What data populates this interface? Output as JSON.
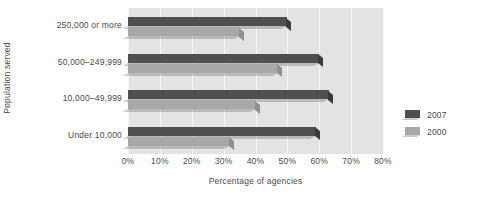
{
  "chart_data": {
    "type": "bar",
    "orientation": "horizontal",
    "title": "",
    "xlabel": "Percentage of agencies",
    "ylabel": "Population served",
    "categories": [
      "250,000 or more",
      "50,000–249,999",
      "10,000–49,999",
      "Under 10,000"
    ],
    "series": [
      {
        "name": "2007",
        "color": "#4f4f4f",
        "values": [
          50,
          60,
          63,
          59
        ]
      },
      {
        "name": "2000",
        "color": "#a8a8a8",
        "values": [
          35,
          47,
          40,
          32
        ]
      }
    ],
    "xticks": [
      "0%",
      "10%",
      "20%",
      "30%",
      "40%",
      "50%",
      "60%",
      "70%",
      "80%"
    ],
    "xtick_values": [
      0,
      10,
      20,
      30,
      40,
      50,
      60,
      70,
      80
    ],
    "xlim": [
      0,
      80
    ],
    "grid": true,
    "legend_position": "right",
    "plot_background": "#e3e3e3",
    "gridline_color": "#f4f4f4",
    "text_color": "#4a4a4a"
  }
}
